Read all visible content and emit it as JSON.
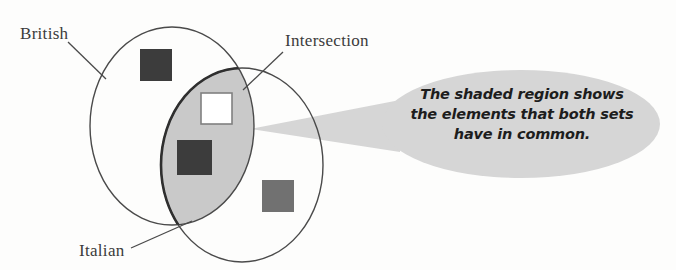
{
  "diagram": {
    "type": "venn-diagram",
    "sets": [
      {
        "name": "British",
        "label": "British",
        "position": "left",
        "ellipse": {
          "cx": 172,
          "cy": 126,
          "rx": 82,
          "ry": 99
        }
      },
      {
        "name": "Italian",
        "label": "Italian",
        "position": "right",
        "ellipse": {
          "cx": 242,
          "cy": 165,
          "rx": 81,
          "ry": 97
        }
      }
    ],
    "intersection": {
      "label": "Intersection",
      "fill_color": "#c9c9c9",
      "stroke_color": "#3a3a3a"
    },
    "elements": [
      {
        "id": "element-british-only",
        "region": "British only",
        "shape": "square",
        "color": "#3c3c3c",
        "x": 140,
        "y": 49,
        "size": 32
      },
      {
        "id": "element-intersection-white",
        "region": "Intersection",
        "shape": "square",
        "color": "#ffffff",
        "border_color": "#808080",
        "x": 201,
        "y": 93,
        "size": 31
      },
      {
        "id": "element-intersection-dark",
        "region": "Intersection",
        "shape": "square",
        "color": "#3c3c3c",
        "x": 177,
        "y": 140,
        "size": 35
      },
      {
        "id": "element-italian-only",
        "region": "Italian only",
        "shape": "square",
        "color": "#717171",
        "x": 262,
        "y": 180,
        "size": 32
      }
    ],
    "leader_lines": [
      {
        "name": "british",
        "x1": 68,
        "y1": 42,
        "x2": 106,
        "y2": 79
      },
      {
        "name": "italian",
        "x1": 131,
        "y1": 248,
        "x2": 192,
        "y2": 221
      },
      {
        "name": "intersection",
        "x1": 283,
        "y1": 52,
        "x2": 243,
        "y2": 90
      }
    ]
  },
  "callout": {
    "name": "callout-bubble",
    "fill_color": "#d6d6d6",
    "ellipse": {
      "cx": 521,
      "cy": 124,
      "rx": 139,
      "ry": 54
    },
    "tail": {
      "tip_x": 250,
      "tip_y": 129
    },
    "text": "The shaded region shows the elements that both sets have in common.",
    "lines": [
      "The shaded region shows",
      "the elements that both sets",
      "have in common."
    ]
  }
}
